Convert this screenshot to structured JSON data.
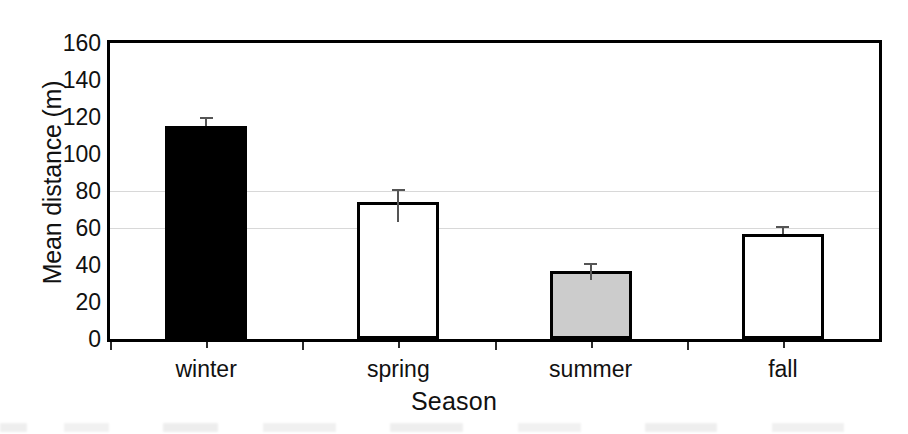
{
  "chart_data": {
    "type": "bar",
    "title": "",
    "subtitle": "",
    "xlabel": "Season",
    "ylabel": "Mean distance (m)",
    "categories": [
      "winter",
      "spring",
      "summer",
      "fall"
    ],
    "values": [
      115,
      74,
      37,
      57
    ],
    "errors_upper": [
      5,
      7,
      4,
      4
    ],
    "errors_lower": [
      0,
      11,
      5,
      0
    ],
    "ylim": [
      0,
      160
    ],
    "ytick_labels": [
      "0",
      "20",
      "40",
      "60",
      "80",
      "100",
      "120",
      "140",
      "160"
    ],
    "ytick_values": [
      0,
      20,
      40,
      60,
      80,
      100,
      120,
      140,
      160
    ],
    "grid": "horizontal-faint",
    "legend": "none",
    "series": [
      {
        "name": "Mean distance",
        "values": [
          115,
          74,
          37,
          57
        ],
        "bar_styles": [
          "solid-black",
          "open-white",
          "shaded-gray",
          "open-white"
        ]
      }
    ],
    "colors": {
      "bar_winter": "#000000",
      "bar_spring": "#ffffff",
      "bar_summer": "#cccccc",
      "bar_fall": "#ffffff",
      "bar_outline": "#000000",
      "axis": "#000000",
      "gridline": "#d8d8d8",
      "error_bar": "#555555",
      "text": "#111111",
      "background": "#ffffff"
    }
  },
  "axis": {
    "y_title": "Mean distance (m)",
    "x_title": "Season"
  }
}
